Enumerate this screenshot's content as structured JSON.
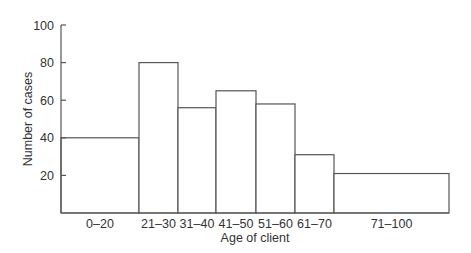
{
  "chart_data": {
    "type": "bar",
    "subtype": "histogram",
    "title": "",
    "xlabel": "Age of client",
    "ylabel": "Number of cases",
    "ylim": [
      0,
      100
    ],
    "yticks": [
      20,
      40,
      60,
      80,
      100
    ],
    "grid": false,
    "legend": null,
    "categories": [
      "0–20",
      "21–30",
      "31–40",
      "41–50",
      "51–60",
      "61–70",
      "71–100"
    ],
    "values": [
      40,
      80,
      56,
      65,
      58,
      31,
      21
    ],
    "bin_edges_px": [
      61,
      139,
      178,
      216,
      256,
      295,
      334,
      449
    ]
  },
  "colors": {
    "bar_fill": "#ffffff",
    "bar_stroke": "#555555",
    "text": "#333333"
  }
}
